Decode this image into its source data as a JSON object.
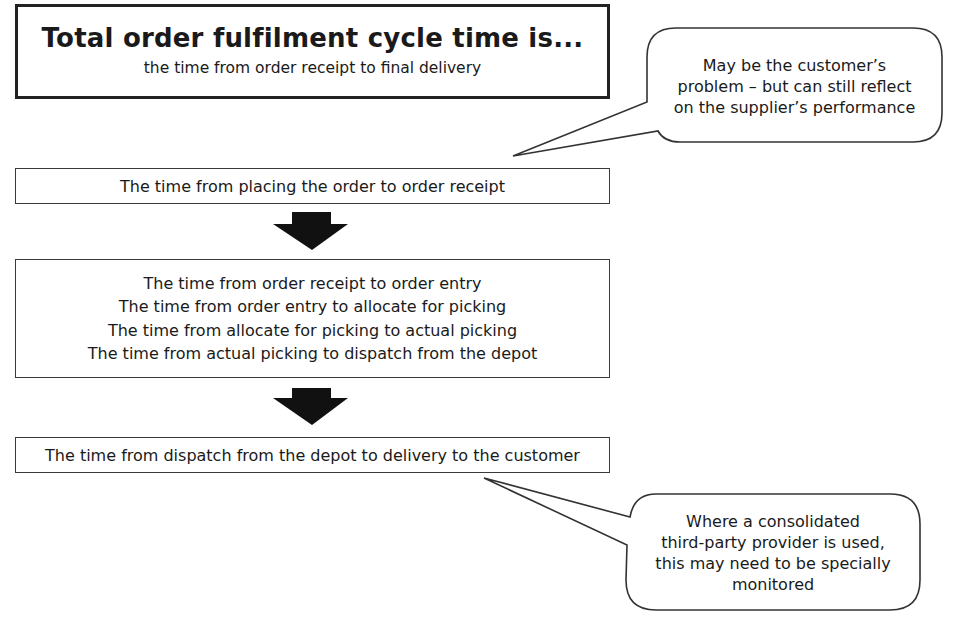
{
  "diagram": {
    "title": {
      "heading": "Total order fulfilment cycle time is...",
      "subheading": "the time from order receipt to final delivery"
    },
    "stages": [
      {
        "id": "stage1",
        "lines": [
          "The time from placing the order to order receipt"
        ]
      },
      {
        "id": "stage2",
        "lines": [
          "The time from order receipt to order entry",
          "The time from order entry to allocate for picking",
          "The time from allocate for picking to actual picking",
          "The time from actual picking to dispatch from the depot"
        ]
      },
      {
        "id": "stage3",
        "lines": [
          "The time from dispatch from the depot to delivery to the customer"
        ]
      }
    ],
    "arrows": [
      {
        "from": "stage1",
        "to": "stage2",
        "icon": "down-arrow-icon"
      },
      {
        "from": "stage2",
        "to": "stage3",
        "icon": "down-arrow-icon"
      }
    ],
    "callouts": [
      {
        "id": "callout-customer",
        "points_to": "stage1",
        "lines": [
          "May be the customer’s",
          "problem – but can still reflect",
          "on the supplier’s performance"
        ]
      },
      {
        "id": "callout-third-party",
        "points_to": "stage3",
        "lines": [
          "Where a consolidated",
          "third-party provider is used,",
          "this may need to be specially",
          "monitored"
        ]
      }
    ],
    "colors": {
      "background": "#ffffff",
      "stroke": "#333333",
      "arrow_fill": "#111111",
      "text": "#1a1a1a"
    }
  }
}
